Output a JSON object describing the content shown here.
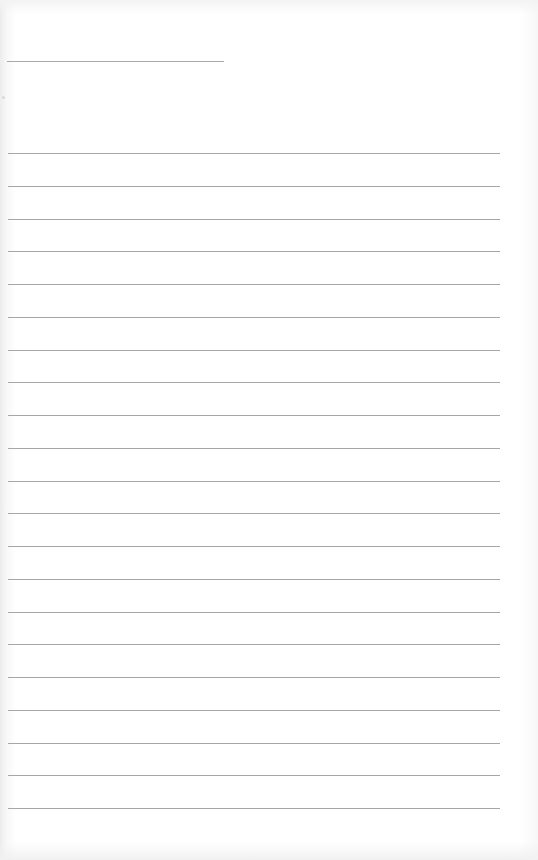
{
  "document": {
    "type": "blank lined page",
    "header_line": {
      "x": 7,
      "y": 61,
      "width": 217
    },
    "rules": {
      "count": 21,
      "x": 8,
      "width": 492,
      "first_y": 153,
      "spacing": 32.75,
      "color": "#a6a6a6"
    },
    "background_color": "#ffffff",
    "text": []
  }
}
